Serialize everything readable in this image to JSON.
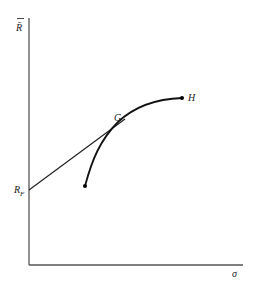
{
  "diagram": {
    "type": "efficient-frontier",
    "axes": {
      "y_label": "R̄",
      "x_label": "σ"
    },
    "points": {
      "risk_free": {
        "label": "R",
        "subscript": "F"
      },
      "tangency": {
        "label": "G"
      },
      "end": {
        "label": "H"
      }
    },
    "colors": {
      "axis": "#555555",
      "curve": "#111111",
      "line": "#222222",
      "background": "#ffffff"
    }
  }
}
